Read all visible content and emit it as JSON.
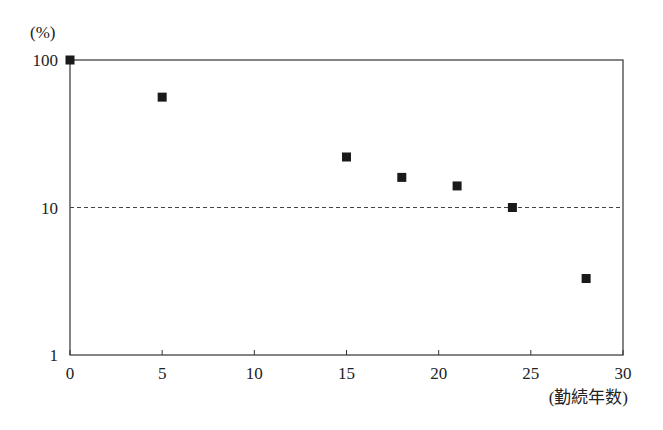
{
  "chart_data": {
    "type": "scatter",
    "title": "",
    "xlabel": "(勤続年数)",
    "ylabel": "(%)",
    "x_ticks": [
      "0",
      "5",
      "10",
      "15",
      "20",
      "25",
      "30"
    ],
    "y_ticks": [
      "1",
      "10",
      "100"
    ],
    "xlim": [
      0,
      30
    ],
    "ylim": [
      1,
      100
    ],
    "y_scale": "log",
    "grid": false,
    "reference_line": {
      "y": 10,
      "style": "dashed"
    },
    "legend": null,
    "series": [
      {
        "name": "",
        "marker": "square",
        "color": "#1a1a1a",
        "x": [
          0,
          5,
          15,
          18,
          21,
          24,
          28
        ],
        "y": [
          100,
          56,
          22,
          16,
          14,
          10,
          3.3
        ]
      }
    ]
  }
}
